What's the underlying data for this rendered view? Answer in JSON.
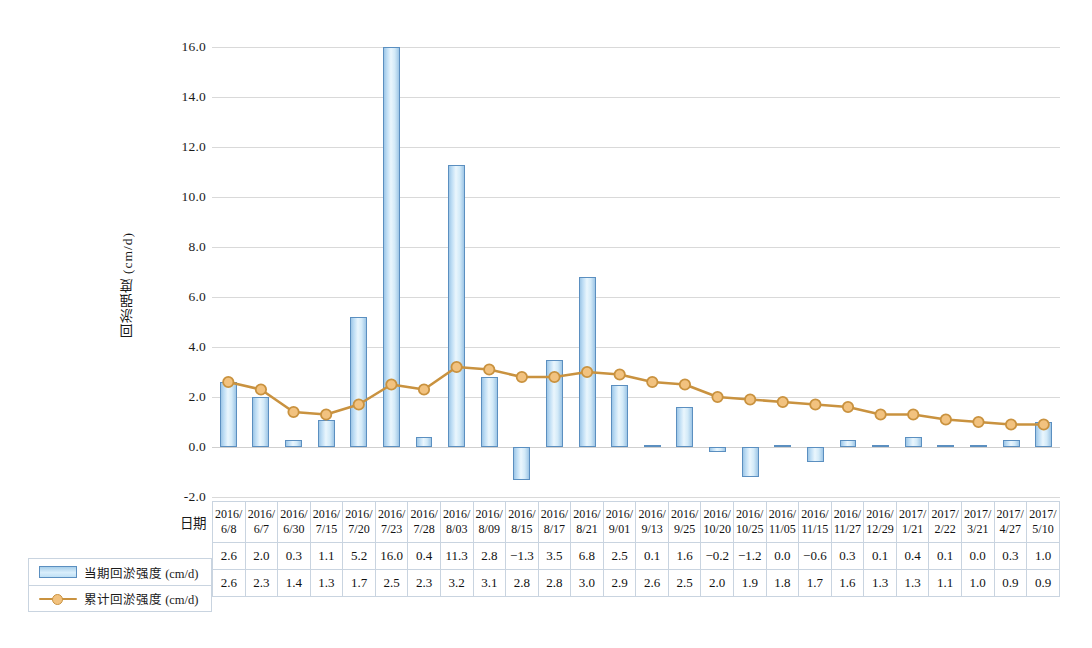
{
  "chart_data": {
    "type": "bar",
    "title": "",
    "xlabel": "",
    "ylabel": "回淤强度 (cm/d)",
    "ylim": [
      -2.0,
      16.0
    ],
    "ytick_labels": [
      "16.0",
      "14.0",
      "12.0",
      "10.0",
      "8.0",
      "6.0",
      "4.0",
      "2.0",
      "0.0",
      "-2.0"
    ],
    "ytick_values": [
      16.0,
      14.0,
      12.0,
      10.0,
      8.0,
      6.0,
      4.0,
      2.0,
      0.0,
      -2.0
    ],
    "grid": true,
    "legend_position": "bottom-left",
    "categories": [
      "2016/\n6/8",
      "2016/\n6/7",
      "2016/\n6/30",
      "2016/\n7/15",
      "2016/\n7/20",
      "2016/\n7/23",
      "2016/\n7/28",
      "2016/\n8/03",
      "2016/\n8/09",
      "2016/\n8/15",
      "2016/\n8/17",
      "2016/\n8/21",
      "2016/\n9/01",
      "2016/\n9/13",
      "2016/\n9/25",
      "2016/\n10/20",
      "2016/\n10/25",
      "2016/\n11/05",
      "2016/\n11/15",
      "2016/\n11/27",
      "2016/\n12/29",
      "2017/\n1/21",
      "2017/\n2/22",
      "2017/\n3/21",
      "2017/\n4/27",
      "2017/\n5/10"
    ],
    "category_year": [
      "2016/",
      "2016/",
      "2016/",
      "2016/",
      "2016/",
      "2016/",
      "2016/",
      "2016/",
      "2016/",
      "2016/",
      "2016/",
      "2016/",
      "2016/",
      "2016/",
      "2016/",
      "2016/",
      "2016/",
      "2016/",
      "2016/",
      "2016/",
      "2016/",
      "2017/",
      "2017/",
      "2017/",
      "2017/",
      "2017/"
    ],
    "category_day": [
      "6/8",
      "6/7",
      "6/30",
      "7/15",
      "7/20",
      "7/23",
      "7/28",
      "8/03",
      "8/09",
      "8/15",
      "8/17",
      "8/21",
      "9/01",
      "9/13",
      "9/25",
      "10/20",
      "10/25",
      "11/05",
      "11/15",
      "11/27",
      "12/29",
      "1/21",
      "2/22",
      "3/21",
      "4/27",
      "5/10"
    ],
    "series": [
      {
        "name": "当期回淤强度 (cm/d)",
        "type": "bar",
        "color": "#a8cfea",
        "border_color": "#5b8fc0",
        "values": [
          2.6,
          2.0,
          0.3,
          1.1,
          5.2,
          16.0,
          0.4,
          11.3,
          2.8,
          -1.3,
          3.5,
          6.8,
          2.5,
          0.1,
          1.6,
          -0.2,
          -1.2,
          0.0,
          -0.6,
          0.3,
          0.1,
          0.4,
          0.1,
          0.0,
          0.3,
          1.0
        ],
        "labels": [
          "2.6",
          "2.0",
          "0.3",
          "1.1",
          "5.2",
          "16.0",
          "0.4",
          "11.3",
          "2.8",
          "-1.3",
          "3.5",
          "6.8",
          "2.5",
          "0.1",
          "1.6",
          "-0.2",
          "-1.2",
          "0.0",
          "-0.6",
          "0.3",
          "0.1",
          "0.4",
          "0.1",
          "0.0",
          "0.3",
          "1.0"
        ]
      },
      {
        "name": "累计回淤强度 (cm/d)",
        "type": "line",
        "color": "#c9923f",
        "marker_color": "#f2c27f",
        "values": [
          2.6,
          2.3,
          1.4,
          1.3,
          1.7,
          2.5,
          2.3,
          3.2,
          3.1,
          2.8,
          2.8,
          3.0,
          2.9,
          2.6,
          2.5,
          2.0,
          1.9,
          1.8,
          1.7,
          1.6,
          1.3,
          1.3,
          1.1,
          1.0,
          0.9,
          0.9
        ],
        "labels": [
          "2.6",
          "2.3",
          "1.4",
          "1.3",
          "1.7",
          "2.5",
          "2.3",
          "3.2",
          "3.1",
          "2.8",
          "2.8",
          "3.0",
          "2.9",
          "2.6",
          "2.5",
          "2.0",
          "1.9",
          "1.8",
          "1.7",
          "1.6",
          "1.3",
          "1.3",
          "1.1",
          "1.0",
          "0.9",
          "0.9"
        ]
      }
    ]
  },
  "table": {
    "row_label_date": "日期"
  },
  "legend": {
    "items": [
      {
        "label": "当期回淤强度 (cm/d)",
        "marker": "bar-swatch"
      },
      {
        "label": "累计回淤强度 (cm/d)",
        "marker": "line-marker"
      }
    ]
  }
}
